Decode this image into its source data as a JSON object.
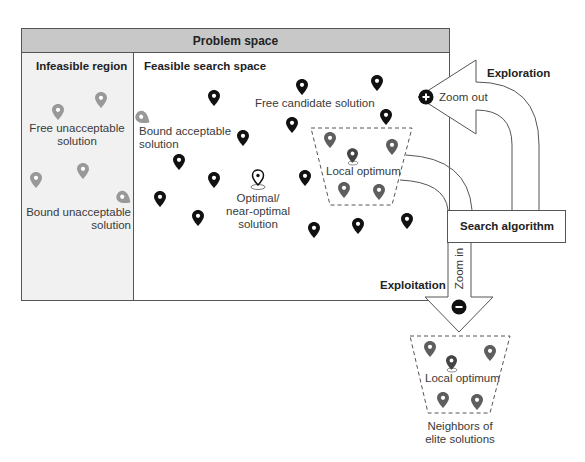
{
  "header": {
    "title": "Problem space"
  },
  "infeasible": {
    "title": "Infeasible region",
    "free_label": "Free unacceptable solution",
    "free_label_l1": "Free unacceptable",
    "free_label_l2": "solution",
    "bound_label_l1": "Bound unacceptable",
    "bound_label_l2": "solution"
  },
  "feasible": {
    "title": "Feasible search space",
    "free_candidate": "Free candidate solution",
    "bound_acceptable_l1": "Bound acceptable",
    "bound_acceptable_l2": "solution",
    "optimal_l1": "Optimal/",
    "optimal_l2": "near-optimal solution",
    "local_optimum": "Local optimum"
  },
  "search": {
    "label": "Search algorithm",
    "exploration": "Exploration",
    "zoom_out": "Zoom out",
    "exploitation": "Exploitation",
    "zoom_in": "Zoom in"
  },
  "elite": {
    "local_optimum": "Local optimum",
    "caption_l1": "Neighbors of",
    "caption_l2": "elite solutions"
  },
  "colors": {
    "header_bg": "#c8c8c8",
    "infeasible_bg": "#f1f1f1",
    "marker_black": "#111111",
    "marker_gray": "#8a8a8a",
    "marker_dark_gray": "#5e5e5e",
    "border": "#555555"
  }
}
